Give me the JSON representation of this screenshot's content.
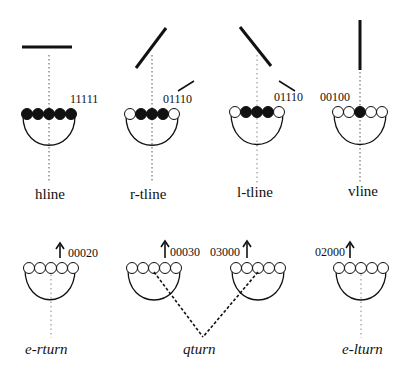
{
  "diagram": {
    "top_row": [
      {
        "name": "hline",
        "code": "11111",
        "filled": [
          1,
          1,
          1,
          1,
          1
        ],
        "cx": 49,
        "bar": {
          "x1": 22,
          "y1": 47,
          "x2": 72,
          "y2": 47
        }
      },
      {
        "name": "r-tline",
        "code": "01110",
        "filled": [
          0,
          1,
          1,
          1,
          0
        ],
        "cx": 152,
        "bar": {
          "x1": 136,
          "y1": 68,
          "x2": 166,
          "y2": 28
        }
      },
      {
        "name": "l-tline",
        "code": "01110",
        "filled": [
          0,
          1,
          1,
          1,
          0
        ],
        "cx": 257,
        "bar": {
          "x1": 240,
          "y1": 27,
          "x2": 271,
          "y2": 66
        }
      },
      {
        "name": "vline",
        "code": "00100",
        "filled": [
          0,
          0,
          1,
          0,
          0
        ],
        "cx": 359,
        "bar": {
          "x1": 360,
          "y1": 20,
          "x2": 360,
          "y2": 70
        }
      }
    ],
    "bottom_row": [
      {
        "name": "e-rturn",
        "code": "00020",
        "arrow_side": "left"
      },
      {
        "name": "qturn",
        "codes": [
          "00030",
          "03000"
        ]
      },
      {
        "name": "e-lturn",
        "code": "02000",
        "arrow_side": "right"
      }
    ]
  },
  "labels": {
    "hline": "hline",
    "r_tline": "r-tline",
    "l_tline": "l-tline",
    "vline": "vline",
    "e_rturn": "e-rturn",
    "qturn": "qturn",
    "e_lturn": "e-lturn"
  },
  "codes": {
    "hline": "11111",
    "r_tline": "01110",
    "l_tline": "01110",
    "vline": "00100",
    "e_rturn": "00020",
    "qturn_left": "00030",
    "qturn_right": "03000",
    "e_lturn": "02000"
  },
  "colors": {
    "ink": "#111111",
    "dotted": "#666666",
    "background": "#ffffff"
  }
}
